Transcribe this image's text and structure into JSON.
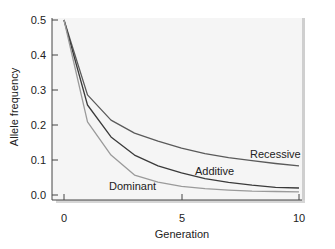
{
  "chart_data": {
    "type": "line",
    "title": "",
    "xlabel": "Generation",
    "ylabel": "Allele frequency",
    "xlim": [
      0,
      10
    ],
    "ylim": [
      0,
      0.5
    ],
    "x_ticks": [
      "0",
      "5",
      "10"
    ],
    "y_ticks": [
      "0.0",
      "0.1",
      "0.2",
      "0.3",
      "0.4",
      "0.5"
    ],
    "grid": false,
    "legend": "inline labels",
    "x": [
      0,
      1,
      2,
      3,
      4,
      5,
      6,
      7,
      8,
      9,
      10
    ],
    "series": [
      {
        "name": "Recessive",
        "color": "#5a5a5a",
        "values": [
          0.5,
          0.286,
          0.214,
          0.177,
          0.154,
          0.134,
          0.118,
          0.107,
          0.098,
          0.09,
          0.083
        ]
      },
      {
        "name": "Additive",
        "color": "#3a3a3a",
        "values": [
          0.5,
          0.257,
          0.166,
          0.114,
          0.083,
          0.063,
          0.047,
          0.036,
          0.028,
          0.022,
          0.02
        ]
      },
      {
        "name": "Dominant",
        "color": "#9a9a9a",
        "values": [
          0.5,
          0.209,
          0.114,
          0.057,
          0.037,
          0.025,
          0.018,
          0.014,
          0.011,
          0.01,
          0.009
        ]
      }
    ]
  },
  "labels": {
    "xlabel": "Generation",
    "ylabel": "Allele frequency",
    "recessive": "Recessive",
    "additive": "Additive",
    "dominant": "Dominant",
    "y0": "0.0",
    "y1": "0.1",
    "y2": "0.2",
    "y3": "0.3",
    "y4": "0.4",
    "y5": "0.5",
    "x0": "0",
    "x5": "5",
    "x10": "10"
  }
}
